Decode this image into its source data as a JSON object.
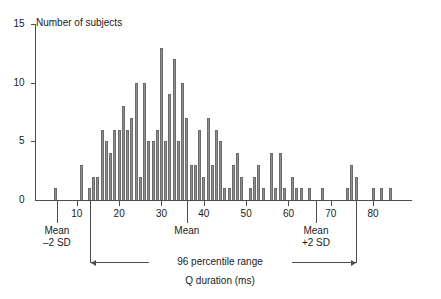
{
  "chart_data": {
    "type": "bar",
    "title": "",
    "ylabel": "Number of subjects",
    "xlabel": "Q duration (ms)",
    "xlim": [
      0,
      90
    ],
    "ylim": [
      0,
      15
    ],
    "xticks": [
      10,
      20,
      30,
      40,
      50,
      60,
      70,
      80
    ],
    "yticks": [
      0,
      5,
      10,
      15
    ],
    "bin_width": 1,
    "grid": false,
    "legend": null,
    "x": [
      5,
      11,
      13,
      14,
      15,
      16,
      17,
      18,
      19,
      20,
      21,
      22,
      23,
      24,
      25,
      26,
      27,
      28,
      29,
      30,
      31,
      32,
      33,
      34,
      35,
      36,
      37,
      38,
      39,
      40,
      41,
      42,
      43,
      44,
      45,
      46,
      47,
      48,
      49,
      51,
      52,
      53,
      54,
      56,
      57,
      58,
      59,
      61,
      62,
      63,
      65,
      68,
      74,
      75,
      76,
      80,
      82,
      84
    ],
    "values": [
      1,
      3,
      1,
      2,
      2,
      6,
      5,
      4,
      6,
      6,
      8,
      6,
      7,
      10,
      2,
      10,
      5,
      5,
      6,
      13,
      5,
      9,
      12,
      5,
      10,
      7,
      3,
      3,
      6,
      2,
      7,
      3,
      6,
      5,
      1,
      1,
      3,
      4,
      2,
      1,
      2,
      3,
      1,
      4,
      1,
      4,
      1,
      2,
      1,
      1,
      1,
      1,
      1,
      3,
      2,
      1,
      1,
      1
    ]
  },
  "axes": {
    "y_title": "Number of subjects",
    "x_title": "Q duration (ms)",
    "y_tick_labels": [
      "15",
      "10",
      "5",
      "0"
    ],
    "x_tick_labels": [
      "10",
      "20",
      "30",
      "40",
      "50",
      "60",
      "70",
      "80"
    ]
  },
  "annotations": {
    "mean_minus_2sd_line1": "Mean",
    "mean_minus_2sd_line2": "–2 SD",
    "mean_line1": "Mean",
    "mean_plus_2sd_line1": "Mean",
    "mean_plus_2sd_line2": "+2 SD",
    "percentile_range": "96 percentile range",
    "mean_minus_2sd_value": 5.3,
    "mean_value": 36,
    "mean_plus_2sd_value": 66.5,
    "range_start": 13,
    "range_end": 76
  },
  "colors": {
    "bar_fill": "#8f8f8f",
    "bar_edge": "#6b6b6b",
    "axis": "#4d4d4d",
    "text": "#1a1a1a",
    "background": "#ffffff"
  }
}
